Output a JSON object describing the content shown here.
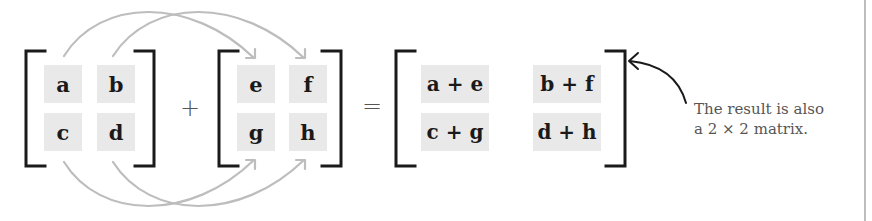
{
  "diagram": {
    "matrix_a": {
      "cells": [
        [
          "a",
          "b"
        ],
        [
          "c",
          "d"
        ]
      ]
    },
    "operator_plus": "+",
    "matrix_b": {
      "cells": [
        [
          "e",
          "f"
        ],
        [
          "g",
          "h"
        ]
      ]
    },
    "operator_equals": "=",
    "result": {
      "cells": [
        [
          "a + e",
          "b + f"
        ],
        [
          "c + g",
          "d + h"
        ]
      ]
    },
    "annotation": {
      "line1": "The result is also",
      "line2": "a 2 × 2 matrix."
    },
    "colors": {
      "bracket": "#1a1a1a",
      "cell_bg": "#e9e9e9",
      "arrow": "#bdbdbd",
      "annotation_text": "#555555",
      "divider": "#bdbdbd"
    }
  }
}
